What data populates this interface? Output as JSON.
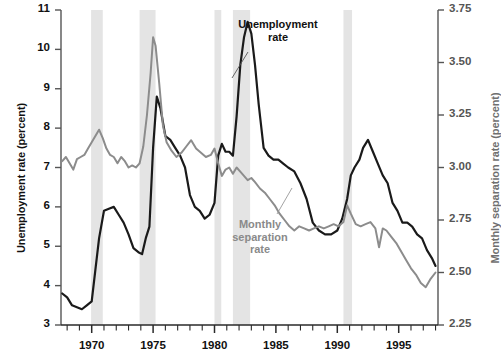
{
  "chart_data": {
    "type": "line",
    "title": "",
    "subtitle": "",
    "xlabel": "",
    "ylabel": "Unemployment rate (percent)",
    "y2label": "Monthly separation rate (percent)",
    "grid": false,
    "legend_position": "inline-annotations",
    "xlim": [
      1967.5,
      1998.2
    ],
    "ylim": [
      3,
      11
    ],
    "y2lim": [
      2.25,
      3.75
    ],
    "yticks": [
      3,
      4,
      5,
      6,
      7,
      8,
      9,
      10,
      11
    ],
    "ytick_labels": [
      "3",
      "4",
      "5",
      "6",
      "7",
      "8",
      "9",
      "10",
      "11"
    ],
    "y2ticks": [
      2.25,
      2.5,
      2.75,
      3.0,
      3.25,
      3.5,
      3.75
    ],
    "y2tick_labels": [
      "2.25",
      "2.50",
      "2.75",
      "3.00",
      "3.25",
      "3.50",
      "3.75"
    ],
    "xticks": [
      1970,
      1975,
      1980,
      1985,
      1990,
      1995
    ],
    "xtick_labels": [
      "1970",
      "1975",
      "1980",
      "1985",
      "1990",
      "1995"
    ],
    "xtick_minor_interval": 1,
    "colors": {
      "unemployment": "#1a1a1a",
      "separation": "#8c8c8c",
      "recession_band": "#e4e4e4",
      "axis": "#555555",
      "background": "#ffffff"
    },
    "recession_bands": [
      {
        "start": 1969.95,
        "end": 1970.9
      },
      {
        "start": 1973.9,
        "end": 1975.2
      },
      {
        "start": 1980.0,
        "end": 1980.55
      },
      {
        "start": 1981.5,
        "end": 1982.9
      },
      {
        "start": 1990.5,
        "end": 1991.2
      }
    ],
    "series": [
      {
        "name": "Unemployment rate",
        "axis": "left",
        "color": "#1a1a1a",
        "label_text": "Unemployment\nrate",
        "x": [
          1967.6,
          1968.0,
          1968.4,
          1968.8,
          1969.2,
          1969.6,
          1970.0,
          1970.3,
          1970.6,
          1971.0,
          1971.4,
          1971.8,
          1972.2,
          1972.6,
          1973.0,
          1973.4,
          1973.8,
          1974.1,
          1974.4,
          1974.7,
          1975.0,
          1975.3,
          1975.6,
          1976.0,
          1976.4,
          1976.8,
          1977.2,
          1977.6,
          1978.0,
          1978.4,
          1978.8,
          1979.2,
          1979.6,
          1980.0,
          1980.3,
          1980.6,
          1980.9,
          1981.2,
          1981.5,
          1981.8,
          1982.1,
          1982.4,
          1982.7,
          1983.0,
          1983.3,
          1983.6,
          1984.0,
          1984.4,
          1984.8,
          1985.2,
          1985.6,
          1986.0,
          1986.5,
          1987.0,
          1987.5,
          1988.0,
          1988.5,
          1989.0,
          1989.5,
          1990.0,
          1990.4,
          1990.8,
          1991.1,
          1991.4,
          1991.8,
          1992.1,
          1992.5,
          1992.9,
          1993.3,
          1993.7,
          1994.1,
          1994.5,
          1994.9,
          1995.3,
          1995.7,
          1996.1,
          1996.5,
          1996.9,
          1997.3,
          1997.7,
          1998.0
        ],
        "y": [
          3.8,
          3.7,
          3.5,
          3.45,
          3.4,
          3.5,
          3.6,
          4.4,
          5.2,
          5.9,
          5.95,
          6.0,
          5.8,
          5.6,
          5.3,
          4.95,
          4.85,
          4.8,
          5.2,
          5.5,
          7.5,
          8.8,
          8.5,
          7.8,
          7.7,
          7.5,
          7.3,
          7.0,
          6.3,
          6.0,
          5.9,
          5.7,
          5.8,
          6.1,
          7.3,
          7.6,
          7.4,
          7.4,
          7.3,
          8.3,
          9.6,
          10.3,
          10.7,
          10.4,
          9.6,
          8.6,
          7.5,
          7.3,
          7.2,
          7.2,
          7.1,
          7.0,
          6.9,
          6.6,
          6.2,
          5.6,
          5.4,
          5.3,
          5.3,
          5.4,
          5.7,
          6.2,
          6.8,
          7.0,
          7.2,
          7.5,
          7.7,
          7.4,
          7.1,
          6.8,
          6.6,
          6.1,
          5.9,
          5.6,
          5.6,
          5.5,
          5.3,
          5.2,
          4.9,
          4.7,
          4.5
        ]
      },
      {
        "name": "Monthly separation rate",
        "axis": "right",
        "color": "#8c8c8c",
        "label_text": "Monthly\nseparation\nrate",
        "x": [
          1967.6,
          1967.9,
          1968.2,
          1968.5,
          1968.8,
          1969.1,
          1969.4,
          1969.7,
          1970.0,
          1970.3,
          1970.6,
          1970.9,
          1971.2,
          1971.5,
          1971.8,
          1972.1,
          1972.4,
          1972.7,
          1973.0,
          1973.3,
          1973.6,
          1973.9,
          1974.2,
          1974.5,
          1974.8,
          1975.0,
          1975.2,
          1975.5,
          1975.8,
          1976.1,
          1976.5,
          1976.9,
          1977.3,
          1977.7,
          1978.1,
          1978.5,
          1978.9,
          1979.3,
          1979.7,
          1980.0,
          1980.3,
          1980.6,
          1980.9,
          1981.2,
          1981.5,
          1981.8,
          1982.1,
          1982.4,
          1982.7,
          1983.0,
          1983.3,
          1983.7,
          1984.1,
          1984.5,
          1984.9,
          1985.3,
          1985.7,
          1986.1,
          1986.5,
          1986.9,
          1987.3,
          1987.7,
          1988.1,
          1988.5,
          1988.9,
          1989.3,
          1989.7,
          1990.1,
          1990.5,
          1990.8,
          1991.1,
          1991.5,
          1991.9,
          1992.3,
          1992.7,
          1993.1,
          1993.4,
          1993.7,
          1994.0,
          1994.4,
          1994.8,
          1995.2,
          1995.6,
          1996.0,
          1996.4,
          1996.8,
          1997.2,
          1997.6,
          1998.0
        ],
        "y": [
          3.03,
          3.05,
          3.02,
          2.99,
          3.04,
          3.05,
          3.06,
          3.09,
          3.12,
          3.15,
          3.18,
          3.14,
          3.09,
          3.06,
          3.05,
          3.02,
          3.05,
          3.03,
          3.0,
          3.01,
          3.0,
          3.02,
          3.1,
          3.25,
          3.45,
          3.62,
          3.58,
          3.4,
          3.2,
          3.12,
          3.08,
          3.05,
          3.07,
          3.1,
          3.13,
          3.09,
          3.07,
          3.05,
          3.06,
          3.09,
          3.02,
          2.96,
          2.99,
          3.0,
          2.97,
          3.0,
          2.98,
          2.96,
          2.94,
          2.95,
          2.93,
          2.9,
          2.88,
          2.85,
          2.82,
          2.78,
          2.75,
          2.72,
          2.7,
          2.72,
          2.71,
          2.7,
          2.71,
          2.72,
          2.71,
          2.72,
          2.73,
          2.72,
          2.74,
          2.82,
          2.78,
          2.73,
          2.72,
          2.73,
          2.74,
          2.71,
          2.62,
          2.71,
          2.7,
          2.67,
          2.64,
          2.6,
          2.56,
          2.52,
          2.49,
          2.45,
          2.43,
          2.47,
          2.5
        ]
      }
    ]
  },
  "axes": {
    "left_title": "Unemployment rate (percent)",
    "right_title": "Monthly separation rate (percent)"
  },
  "annotations": {
    "unemployment": {
      "line1": "Unemployment",
      "line2": "rate"
    },
    "separation": {
      "line1": "Monthly",
      "line2": "separation",
      "line3": "rate"
    }
  }
}
